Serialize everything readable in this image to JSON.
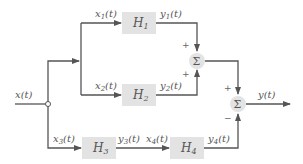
{
  "diagram": {
    "type": "block-diagram",
    "input": {
      "label": "x(t)"
    },
    "output": {
      "label": "y(t)"
    },
    "blocks": [
      {
        "id": "H1",
        "label": "H1",
        "input": "x1(t)",
        "output": "y1(t)"
      },
      {
        "id": "H2",
        "label": "H2",
        "input": "x2(t)",
        "output": "y2(t)"
      },
      {
        "id": "H3",
        "label": "H3",
        "input": "x3(t)",
        "output": "y3(t)"
      },
      {
        "id": "H4",
        "label": "H4",
        "input": "x4(t)",
        "output": "y4(t)"
      }
    ],
    "summers": [
      {
        "id": "sum1",
        "symbol": "Σ",
        "signs": [
          "+",
          "+"
        ]
      },
      {
        "id": "sum2",
        "symbol": "Σ",
        "signs": [
          "+",
          "−"
        ]
      }
    ],
    "labels": {
      "x": "x(t)",
      "x1": "x1(t)",
      "x2": "x2(t)",
      "x3": "x3(t)",
      "x4": "x4(t)",
      "y1": "y1(t)",
      "y2": "y2(t)",
      "y3": "y3(t)",
      "y4": "y4(t)",
      "y": "y(t)",
      "H1": "H",
      "H1_sub": "1",
      "H2": "H",
      "H2_sub": "2",
      "H3": "H",
      "H3_sub": "3",
      "H4": "H",
      "H4_sub": "4",
      "sigma": "Σ",
      "plus": "+",
      "minus": "−"
    }
  }
}
